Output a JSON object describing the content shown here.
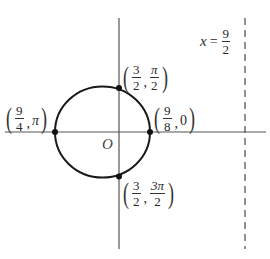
{
  "diagram": {
    "origin_label": "O",
    "asymptote": {
      "var": "x",
      "eq": "=",
      "num": "9",
      "den": "2"
    },
    "points": {
      "top": {
        "r_num": "3",
        "r_den": "2",
        "t_num": "π",
        "t_den": "2"
      },
      "left": {
        "r_num": "9",
        "r_den": "4",
        "t": "π"
      },
      "right": {
        "r_num": "9",
        "r_den": "8",
        "t": "0"
      },
      "bottom": {
        "r_num": "3",
        "r_den": "2",
        "t_num": "3π",
        "t_den": "2"
      }
    },
    "colors": {
      "curve": "#1a1a1a",
      "axis": "#555555",
      "text": "#2a2a2a"
    }
  }
}
